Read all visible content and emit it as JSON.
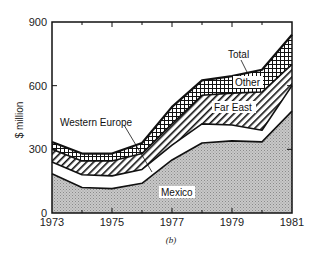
{
  "chart_data": {
    "type": "area",
    "stacked": true,
    "title": "",
    "subtitle": "(b)",
    "xlabel": "",
    "ylabel": "$ million",
    "x": [
      1973,
      1974,
      1975,
      1976,
      1977,
      1978,
      1979,
      1980,
      1981
    ],
    "xticks": [
      1973,
      1975,
      1977,
      1979,
      1981
    ],
    "yticks": [
      0,
      300,
      600,
      900
    ],
    "ylim": [
      0,
      900
    ],
    "xlim": [
      1973,
      1981
    ],
    "grid": false,
    "series": [
      {
        "name": "Mexico",
        "pattern": "dotted-gray",
        "values": [
          185,
          120,
          115,
          140,
          250,
          330,
          340,
          335,
          480
        ]
      },
      {
        "name": "Western Europe",
        "pattern": "white",
        "values": [
          55,
          60,
          60,
          65,
          70,
          90,
          75,
          55,
          120
        ]
      },
      {
        "name": "Far East",
        "pattern": "diagonal-hatch",
        "values": [
          60,
          65,
          70,
          75,
          100,
          135,
          150,
          180,
          100
        ]
      },
      {
        "name": "Other",
        "pattern": "crosshatch",
        "values": [
          35,
          35,
          35,
          50,
          80,
          70,
          80,
          105,
          140
        ]
      }
    ],
    "cumulative_boundaries": {
      "Mexico": [
        185,
        120,
        115,
        140,
        250,
        330,
        340,
        335,
        480
      ],
      "Western Europe": [
        240,
        180,
        175,
        205,
        320,
        420,
        415,
        390,
        600
      ],
      "Far East": [
        300,
        245,
        245,
        280,
        420,
        555,
        565,
        570,
        700
      ],
      "Total": [
        335,
        280,
        280,
        330,
        500,
        625,
        645,
        675,
        840
      ]
    },
    "annotations": [
      "Total",
      "Other",
      "Far East",
      "Western Europe",
      "Mexico"
    ]
  },
  "labels": {
    "ylabel": "$ million",
    "subtitle": "(b)",
    "total": "Total",
    "other": "Other",
    "far_east": "Far East",
    "western_europe": "Western Europe",
    "mexico": "Mexico",
    "y0": "0",
    "y300": "300",
    "y600": "600",
    "y900": "900",
    "x1973": "1973",
    "x1975": "1975",
    "x1977": "1977",
    "x1979": "1979",
    "x1981": "1981"
  }
}
